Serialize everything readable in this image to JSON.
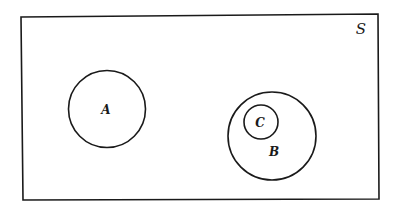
{
  "diagram": {
    "type": "venn",
    "universe": {
      "label": "S"
    },
    "sets": [
      {
        "id": "A",
        "label": "A",
        "relation": "disjoint from B and C"
      },
      {
        "id": "B",
        "label": "B",
        "relation": "contains C"
      },
      {
        "id": "C",
        "label": "C",
        "relation": "subset of B"
      }
    ],
    "stroke_color": "#1a1a1a",
    "background_color": "#ffffff"
  }
}
